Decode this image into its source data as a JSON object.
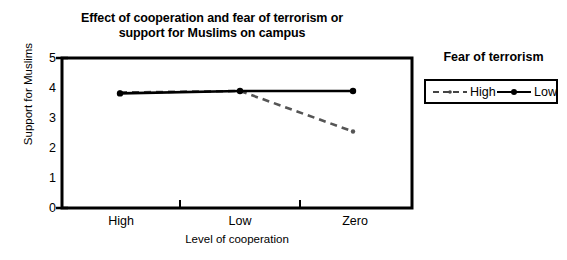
{
  "chart_data": {
    "type": "line",
    "title": "Effect of cooperation and fear of terrorism or support for Muslims on campus",
    "title_line1": "Effect of cooperation and fear of terrorism or",
    "title_line2": "support for Muslims on campus",
    "xlabel": "Level of cooperation",
    "ylabel": "Support for Muslims",
    "categories": [
      "High",
      "Low",
      "Zero"
    ],
    "ylim": [
      0,
      5
    ],
    "yticks": [
      "0",
      "1",
      "2",
      "3",
      "4",
      "5"
    ],
    "ytick_values": [
      0,
      1,
      2,
      3,
      4,
      5
    ],
    "grid": false,
    "legend_position": "right-outside",
    "legend_title": "Fear of terrorism",
    "series": [
      {
        "name": "High",
        "values": [
          3.85,
          3.9,
          2.55
        ],
        "style": "dashed",
        "color": "#555555",
        "marker": "dot"
      },
      {
        "name": "Low",
        "values": [
          3.82,
          3.9,
          3.9
        ],
        "style": "solid",
        "color": "#000000",
        "marker": "dot"
      }
    ]
  },
  "axes": {
    "frame_color": "#000000"
  }
}
